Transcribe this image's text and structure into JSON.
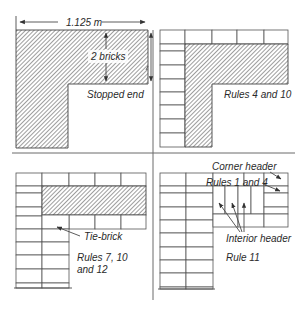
{
  "figure": {
    "panels": [
      {
        "id": "stopped-end",
        "caption": "Stopped end",
        "dimension_width": "1.125 m",
        "dimension_depth": "2 bricks"
      },
      {
        "id": "rules-4-10",
        "caption": "Rules 4 and 10"
      },
      {
        "id": "rules-7-10-12",
        "caption_line1": "Rules 7, 10",
        "caption_line2": "and 12",
        "callout": "Tie-brick"
      },
      {
        "id": "rule-11",
        "caption": "Rule 11",
        "callout_top": "Corner header",
        "callout_rules": "Rules 1 and 4",
        "callout_interior": "Interior header"
      }
    ],
    "colors": {
      "line": "#4a4a4a",
      "hatch": "#6a6a6a",
      "background": "#ffffff"
    }
  }
}
